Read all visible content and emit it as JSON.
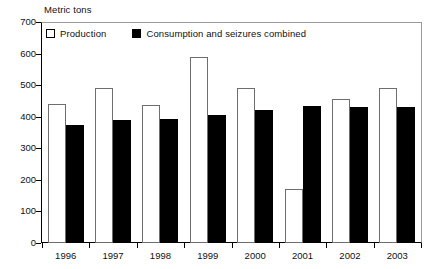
{
  "chart_data": {
    "type": "bar",
    "title": "",
    "ylabel": "Metric tons",
    "xlabel": "",
    "ylim": [
      0,
      700
    ],
    "ytick_step": 100,
    "yticks": [
      700,
      600,
      500,
      400,
      300,
      200,
      100,
      0
    ],
    "grid": false,
    "legend_position": "top-left",
    "categories": [
      "1996",
      "1997",
      "1998",
      "1999",
      "2000",
      "2001",
      "2002",
      "2003"
    ],
    "series": [
      {
        "name": "Production",
        "color": "#ffffff",
        "edge_color": "#000000",
        "values": [
          440,
          491,
          437,
          589,
          491,
          171,
          456,
          491
        ]
      },
      {
        "name": "Consumption and seizures combined",
        "color": "#000000",
        "edge_color": "#000000",
        "values": [
          374,
          390,
          393,
          404,
          421,
          434,
          431,
          431
        ]
      }
    ]
  },
  "legend": {
    "items": [
      {
        "label": "Production",
        "swatch": "open-square-swatch"
      },
      {
        "label": "Consumption and seizures combined",
        "swatch": "filled-square-swatch"
      }
    ]
  },
  "axis": {
    "y_title": "Metric tons",
    "y_labels": [
      "700",
      "600",
      "500",
      "400",
      "300",
      "200",
      "100",
      "0"
    ],
    "x_labels": [
      "1996",
      "1997",
      "1998",
      "1999",
      "2000",
      "2001",
      "2002",
      "2003"
    ]
  }
}
